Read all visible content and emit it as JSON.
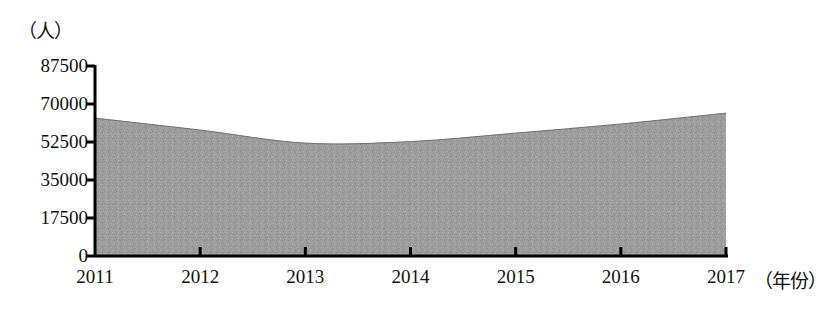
{
  "chart_data": {
    "type": "area",
    "title": "",
    "xlabel": "（年份）",
    "ylabel": "（人）",
    "categories": [
      "2011",
      "2012",
      "2013",
      "2014",
      "2015",
      "2016",
      "2017"
    ],
    "values": [
      63500,
      58000,
      52000,
      52700,
      56600,
      60800,
      65800
    ],
    "series": [
      {
        "name": "人数",
        "values": [
          63500,
          58000,
          52000,
          52700,
          56600,
          60800,
          65800
        ]
      }
    ],
    "ylim": [
      0,
      87500
    ],
    "yticks": [
      0,
      17500,
      35000,
      52500,
      70000,
      87500
    ],
    "ytick_labels": [
      "0",
      "17500",
      "35000",
      "52500",
      "70000",
      "87500"
    ],
    "grid": false,
    "legend": "none",
    "fill_color": "#9a9a9a",
    "axis_color": "#000000"
  },
  "axes": {
    "y_unit": "（人）",
    "x_unit": "（年份）"
  }
}
